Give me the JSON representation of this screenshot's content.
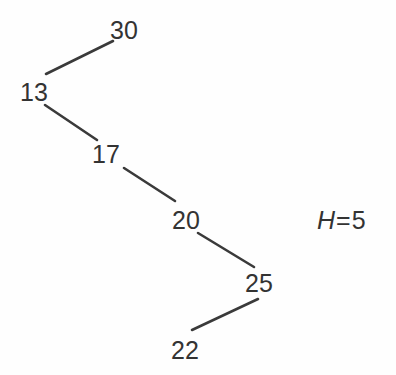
{
  "figure": {
    "type": "binary-tree-diagram",
    "background_color": "#fefefe",
    "stroke_color": "#3a3a3a",
    "text_color": "#333333"
  },
  "nodes": [
    {
      "id": "n30",
      "label": "30",
      "x": 110,
      "y": 18
    },
    {
      "id": "n13",
      "label": "13",
      "x": 20,
      "y": 80
    },
    {
      "id": "n17",
      "label": "17",
      "x": 92,
      "y": 142
    },
    {
      "id": "n20",
      "label": "20",
      "x": 172,
      "y": 208
    },
    {
      "id": "n25",
      "label": "25",
      "x": 245,
      "y": 271
    },
    {
      "id": "n22",
      "label": "22",
      "x": 171,
      "y": 338
    }
  ],
  "edges": [
    {
      "from": "n13",
      "to": "n30",
      "x1": 46,
      "y1": 74,
      "x2": 113,
      "y2": 41
    },
    {
      "from": "n13",
      "to": "n17",
      "x1": 45,
      "y1": 105,
      "x2": 97,
      "y2": 140
    },
    {
      "from": "n17",
      "to": "n20",
      "x1": 124,
      "y1": 168,
      "x2": 175,
      "y2": 201
    },
    {
      "from": "n20",
      "to": "n25",
      "x1": 198,
      "y1": 233,
      "x2": 254,
      "y2": 267
    },
    {
      "from": "n25",
      "to": "n22",
      "x1": 192,
      "y1": 330,
      "x2": 258,
      "y2": 299
    }
  ],
  "annotation": {
    "variable": "H",
    "operator": "=",
    "value": "5"
  }
}
